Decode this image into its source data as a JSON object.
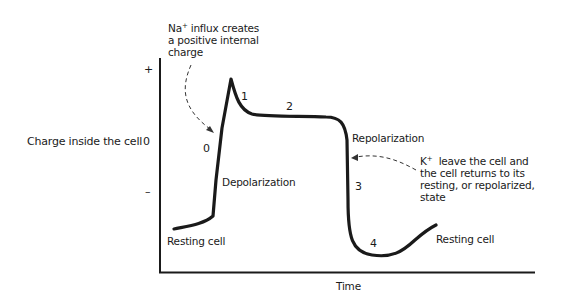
{
  "diagram": {
    "y_axis": {
      "label": "Charge inside the cell",
      "ticks": {
        "plus": "+",
        "zero": "0",
        "minus": "–"
      }
    },
    "x_axis": {
      "label": "Time"
    },
    "phases": {
      "p0": "0",
      "p1": "1",
      "p2": "2",
      "p3": "3",
      "p4": "4"
    },
    "labels": {
      "depolarization": "Depolarization",
      "repolarization": "Repolarization",
      "resting_left": "Resting cell",
      "resting_right": "Resting cell"
    },
    "annotations": {
      "na": {
        "ion": "Na",
        "charge": "+",
        "lines": [
          " influx creates",
          "a positive internal",
          "charge"
        ]
      },
      "k": {
        "ion": "K",
        "charge": "+",
        "lines": [
          "  leave the cell and",
          "the cell returns to its",
          "resting, or repolarized,",
          "state"
        ]
      }
    },
    "colors": {
      "ink": "#1a1a1a",
      "background": "#ffffff"
    }
  }
}
